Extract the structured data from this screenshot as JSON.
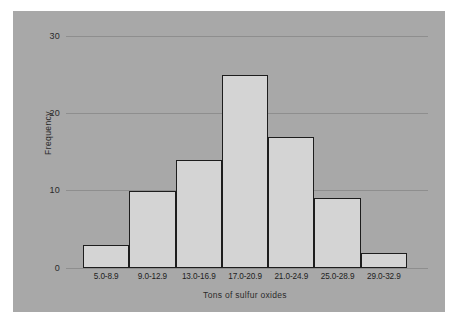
{
  "chart_data": {
    "type": "bar",
    "title": "",
    "subtitle": "",
    "xlabel": "Tons of sulfur oxides",
    "ylabel": "Frequency",
    "categories": [
      "5.0-8.9",
      "9.0-12.9",
      "13.0-16.9",
      "17.0-20.9",
      "21.0-24.9",
      "25.0-28.9",
      "29.0-32.9"
    ],
    "values": [
      3,
      10,
      14,
      25,
      17,
      9,
      2
    ],
    "ylim": [
      0,
      30
    ],
    "yticks": [
      0,
      10,
      20,
      30
    ],
    "ytick_labels": [
      "0",
      "10",
      "20",
      "30"
    ],
    "grid": true,
    "grid_axis": "y",
    "legend": false,
    "legend_position": "none",
    "bar_gap": 0,
    "colors": {
      "panel_background": "#a8a8a8",
      "figure_background": "#ffffff",
      "bar_fill": "#d4d4d4",
      "bar_edge": "#1d1d1d",
      "gridline": "#8e8e8e",
      "text": "#2b2b2b"
    }
  }
}
